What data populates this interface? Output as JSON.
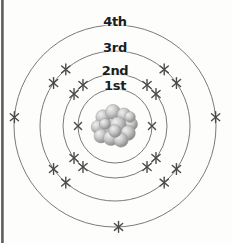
{
  "figure": {
    "type": "atomic-shell-diagram",
    "background_color": "#fdfdfc",
    "stroke_color": "#7a7a7a",
    "label_color": "#1d1d1d",
    "electron_color": "#4a4a4a",
    "center": {
      "x": 115,
      "y": 126
    }
  },
  "nucleus": {
    "name": "nucleus",
    "center": {
      "x": 115,
      "y": 126
    },
    "radius": 22,
    "particle_color_light": "#e2e2e2",
    "particle_color_dark": "#8d8d8d",
    "particles": [
      {
        "x": -12,
        "y": -9,
        "r": 7.2
      },
      {
        "x": -2,
        "y": -14,
        "r": 7.6
      },
      {
        "x": 9,
        "y": -11,
        "r": 7.0
      },
      {
        "x": 16,
        "y": -2,
        "r": 6.6
      },
      {
        "x": -17,
        "y": 1,
        "r": 6.8
      },
      {
        "x": -8,
        "y": 2,
        "r": 8.0
      },
      {
        "x": 3,
        "y": -1,
        "r": 8.2
      },
      {
        "x": 13,
        "y": 7,
        "r": 7.4
      },
      {
        "x": -14,
        "y": 10,
        "r": 7.0
      },
      {
        "x": -4,
        "y": 12,
        "r": 7.6
      },
      {
        "x": 6,
        "y": 14,
        "r": 7.2
      },
      {
        "x": 0,
        "y": 5,
        "r": 6.4
      },
      {
        "x": -10,
        "y": -2,
        "r": 5.6
      },
      {
        "x": 15,
        "y": -9,
        "r": 5.4
      }
    ]
  },
  "shells": [
    {
      "id": "shell-1",
      "label": "1st",
      "radius": 37,
      "label_offset_y": -10,
      "electron_count": 2,
      "electron_style": "x",
      "electron_angles": [
        180,
        0
      ]
    },
    {
      "id": "shell-2",
      "label": "2nd",
      "radius": 52,
      "label_offset_y": -10,
      "electron_count": 8,
      "electron_style": "star",
      "electron_angles": [
        128,
        142,
        38,
        52,
        218,
        232,
        308,
        322
      ]
    },
    {
      "id": "shell-3",
      "label": "3rd",
      "radius": 75,
      "label_offset_y": -10,
      "electron_count": 8,
      "electron_style": "star",
      "electron_angles": [
        131,
        145,
        35,
        49,
        215,
        229,
        311,
        325
      ]
    },
    {
      "id": "shell-4",
      "label": "4th",
      "radius": 101,
      "label_offset_y": -10,
      "electron_count": 3,
      "electron_style": "star",
      "electron_angles": [
        175,
        5,
        272
      ]
    }
  ],
  "labels": {
    "shell_1": "1st",
    "shell_2": "2nd",
    "shell_3": "3rd",
    "shell_4": "4th"
  },
  "chart_data": {
    "type": "diagram",
    "categories": [
      "1st",
      "2nd",
      "3rd",
      "4th"
    ],
    "values": [
      2,
      8,
      8,
      3
    ],
    "xlabel": "Electron shell",
    "ylabel": "Number of electrons",
    "annotations": [
      "1st shell drawn with 2 plain x marks",
      "2nd shell drawn with 8 star-shaped marks",
      "3rd shell drawn with 8 star-shaped marks",
      "4th shell drawn with 3 marks (left, right, bottom)"
    ],
    "legend": [],
    "grid": false
  }
}
